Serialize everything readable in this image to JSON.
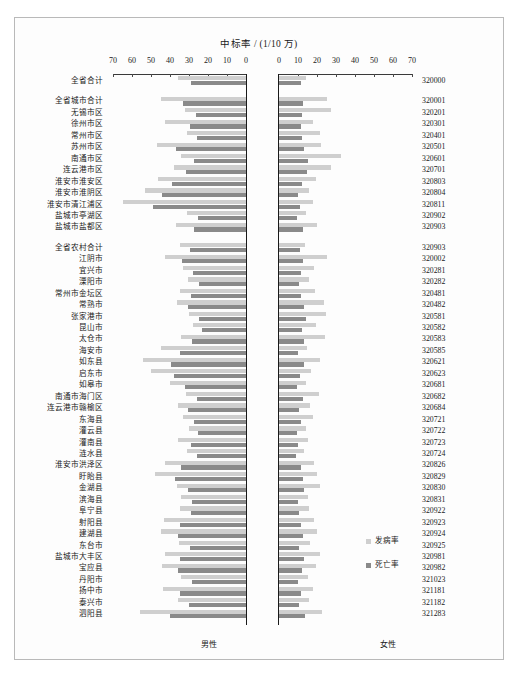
{
  "chart_title": "中标率 / (1/10 万)",
  "legend": {
    "position": "bottom-right",
    "entries": [
      {
        "label": "发病率",
        "color": "#cfcfcf",
        "key": "incidence"
      },
      {
        "label": "死亡率",
        "color": "#8a8a8a",
        "key": "mortality"
      }
    ]
  },
  "panels": {
    "left": {
      "label": "男性"
    },
    "right": {
      "label": "女性"
    }
  },
  "axis": {
    "left_ticks": [
      70,
      60,
      50,
      40,
      30,
      20,
      10,
      0
    ],
    "right_ticks": [
      0,
      10,
      20,
      30,
      40,
      50,
      60,
      70
    ],
    "max": 70,
    "min": 0,
    "grid": false
  },
  "chart_data": {
    "type": "bar",
    "title": "中标率 / (1/10 万)",
    "subtitle": "",
    "xlabel": "中标率 / (1/10 万)",
    "ylabel": "",
    "xlim": [
      0,
      70
    ],
    "grid": false,
    "layout": "back-to-back population pyramid; left panel 男性 (male) axis reversed 70→0, right panel 女性 (female) axis 0→70",
    "legend_position": "bottom-right",
    "series": [
      {
        "name": "发病率",
        "color": "#cfcfcf"
      },
      {
        "name": "死亡率",
        "color": "#8a8a8a"
      }
    ],
    "categories": [
      "全省合计",
      "全省城市合计",
      "无锡市区",
      "徐州市区",
      "常州市区",
      "苏州市区",
      "南通市区",
      "连云港市区",
      "淮安市淮安区",
      "淮安市淮阴区",
      "淮安市清江浦区",
      "盐城市亭湖区",
      "盐城市盐都区",
      "全省农村合计",
      "江阴市",
      "宜兴市",
      "溧阳市",
      "常州市金坛区",
      "常熟市",
      "张家港市",
      "昆山市",
      "太仓市",
      "海安市",
      "如东县",
      "启东市",
      "如皋市",
      "南通市海门区",
      "连云港市赣榆区",
      "东海县",
      "灌云县",
      "灌南县",
      "涟水县",
      "淮安市洪泽区",
      "盱眙县",
      "金湖县",
      "滨海县",
      "阜宁县",
      "射阳县",
      "建湖县",
      "东台市",
      "盐城市大丰区",
      "宝应县",
      "丹阳市",
      "扬中市",
      "泰兴市",
      "泗阳县"
    ],
    "codes": [
      "320000",
      "320001",
      "320201",
      "320301",
      "320401",
      "320501",
      "320601",
      "320701",
      "320803",
      "320804",
      "320811",
      "320902",
      "320903",
      "320903",
      "320002",
      "320281",
      "320282",
      "320481",
      "320482",
      "320581",
      "320582",
      "320583",
      "320585",
      "320621",
      "320623",
      "320681",
      "320682",
      "320684",
      "320721",
      "320722",
      "320723",
      "320724",
      "320826",
      "320829",
      "320830",
      "320831",
      "320922",
      "320923",
      "320924",
      "320925",
      "320981",
      "320982",
      "321023",
      "321181",
      "321182",
      "321283"
    ],
    "group_breaks": [
      1,
      13
    ],
    "male": {
      "incidence": [
        36.0,
        44.5,
        32.0,
        42.5,
        31.0,
        47.0,
        34.0,
        38.0,
        46.5,
        53.0,
        65.0,
        31.0,
        37.0,
        35.0,
        42.5,
        33.0,
        30.5,
        35.0,
        36.5,
        30.0,
        28.0,
        34.0,
        44.5,
        54.0,
        50.0,
        40.0,
        31.5,
        36.0,
        33.0,
        30.0,
        36.0,
        31.0,
        42.5,
        48.0,
        36.5,
        34.0,
        35.0,
        43.0,
        45.0,
        35.5,
        42.5,
        44.0,
        34.0,
        43.5,
        36.0,
        56.0
      ],
      "mortality": [
        29.0,
        33.0,
        26.5,
        29.5,
        26.0,
        37.0,
        27.5,
        31.5,
        39.0,
        44.0,
        49.0,
        25.5,
        27.5,
        29.5,
        33.5,
        28.0,
        24.5,
        29.0,
        30.5,
        25.0,
        23.0,
        28.5,
        35.0,
        39.5,
        38.0,
        32.0,
        26.0,
        30.5,
        27.5,
        25.5,
        29.0,
        26.0,
        34.0,
        37.5,
        30.5,
        28.5,
        29.0,
        34.5,
        36.0,
        29.5,
        34.5,
        36.0,
        28.5,
        35.0,
        30.0,
        40.0
      ]
    },
    "female": {
      "incidence": [
        14.0,
        25.5,
        27.5,
        18.0,
        21.5,
        22.0,
        32.5,
        27.5,
        19.5,
        16.0,
        18.0,
        14.0,
        20.0,
        13.5,
        25.0,
        18.5,
        16.0,
        19.0,
        23.5,
        24.5,
        19.5,
        24.0,
        14.5,
        21.5,
        17.0,
        14.0,
        21.0,
        16.5,
        18.0,
        14.0,
        15.5,
        13.0,
        18.5,
        20.0,
        21.5,
        15.0,
        16.0,
        18.5,
        20.0,
        16.5,
        21.5,
        19.5,
        15.0,
        18.0,
        16.0,
        22.5
      ],
      "mortality": [
        11.5,
        12.5,
        12.0,
        11.5,
        12.0,
        13.0,
        15.0,
        14.5,
        12.0,
        10.0,
        11.0,
        9.5,
        12.5,
        11.0,
        12.5,
        11.5,
        10.5,
        11.5,
        13.0,
        14.0,
        12.0,
        13.0,
        10.0,
        13.0,
        11.0,
        9.5,
        12.5,
        10.5,
        11.5,
        9.5,
        10.0,
        9.0,
        11.5,
        12.5,
        13.0,
        10.0,
        10.5,
        11.5,
        12.5,
        10.5,
        13.0,
        12.0,
        10.0,
        11.5,
        10.5,
        13.5
      ]
    }
  }
}
